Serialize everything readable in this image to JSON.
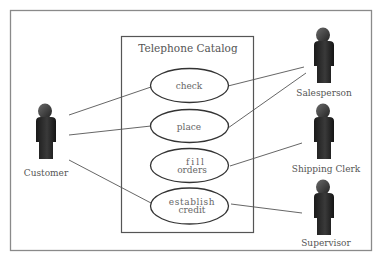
{
  "diagram": {
    "type": "uml-use-case",
    "system": {
      "title": "Telephone Catalog"
    },
    "use_cases": [
      {
        "id": "check",
        "lines": [
          "check"
        ]
      },
      {
        "id": "place",
        "lines": [
          "place"
        ]
      },
      {
        "id": "fill-orders",
        "lines": [
          "fill",
          "orders"
        ]
      },
      {
        "id": "establish-credit",
        "lines": [
          "establish",
          "credit"
        ]
      }
    ],
    "actors": [
      {
        "id": "customer",
        "label": "Customer"
      },
      {
        "id": "salesperson",
        "label": "Salesperson"
      },
      {
        "id": "shipping-clerk",
        "label": "Shipping Clerk"
      },
      {
        "id": "supervisor",
        "label": "Supervisor"
      }
    ],
    "associations": [
      {
        "from": "customer",
        "to": "check"
      },
      {
        "from": "customer",
        "to": "place"
      },
      {
        "from": "customer",
        "to": "establish-credit"
      },
      {
        "from": "salesperson",
        "to": "check"
      },
      {
        "from": "salesperson",
        "to": "place"
      },
      {
        "from": "shipping-clerk",
        "to": "fill-orders"
      },
      {
        "from": "supervisor",
        "to": "establish-credit"
      }
    ],
    "colors": {
      "frame": "#8a8a8a",
      "system_border": "#555555",
      "ellipse_stroke": "#333333",
      "line": "#555555",
      "actor_body": "#2a2a2a",
      "text": "#555555"
    }
  }
}
